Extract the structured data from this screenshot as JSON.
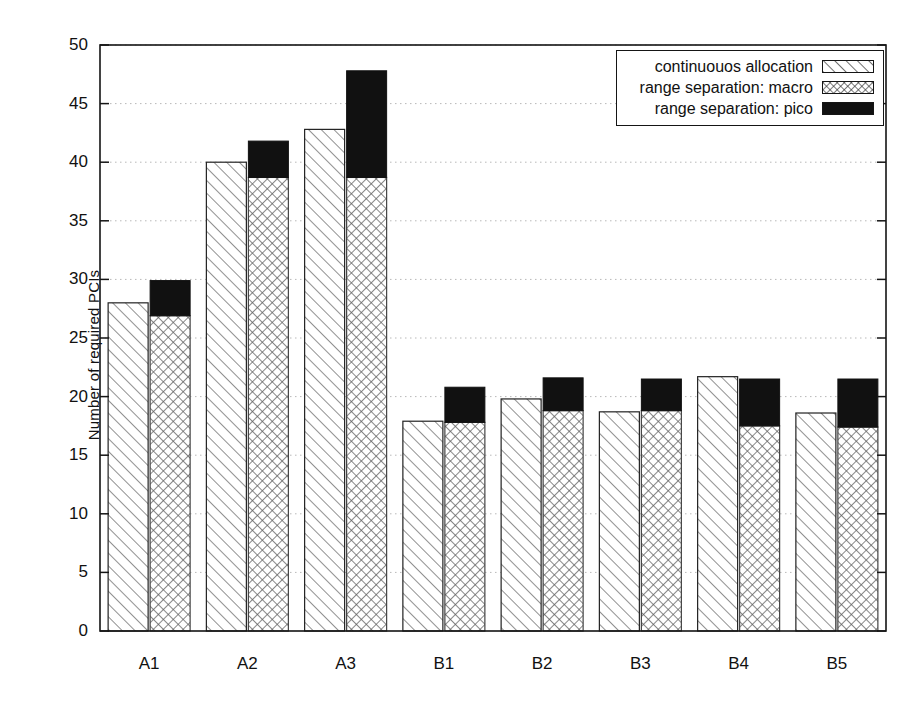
{
  "chart_data": {
    "type": "bar",
    "title": "",
    "subtitle": "",
    "xlabel": "",
    "ylabel": "Number of required PCIs",
    "categories": [
      "A1",
      "A2",
      "A3",
      "B1",
      "B2",
      "B3",
      "B4",
      "B5"
    ],
    "ylim": [
      0,
      50
    ],
    "yticks": [
      0,
      5,
      10,
      15,
      20,
      25,
      30,
      35,
      40,
      45,
      50
    ],
    "ytick_labels": [
      "0",
      "5",
      "10",
      "15",
      "20",
      "25",
      "30",
      "35",
      "40",
      "45",
      "50"
    ],
    "grid": true,
    "grid_style": "dotted-horizontal",
    "legend_position": "top-right",
    "stacked": "second bar is macro + pico stacked",
    "series": [
      {
        "name": "continuouos allocation",
        "pattern": "diagonal-hatch",
        "fill": "#ffffff",
        "line": "#222222",
        "values": [
          28.0,
          40.0,
          42.8,
          17.9,
          19.8,
          18.7,
          21.7,
          18.6
        ]
      },
      {
        "name": "range separation: macro",
        "pattern": "crosshatch",
        "fill": "#ffffff",
        "line": "#444444",
        "values": [
          26.9,
          38.7,
          38.7,
          17.8,
          18.8,
          18.8,
          17.5,
          17.4
        ]
      },
      {
        "name": "range separation: pico",
        "pattern": "solid",
        "fill": "#111111",
        "line": "#111111",
        "values": [
          3.0,
          3.1,
          9.1,
          3.0,
          2.8,
          2.7,
          4.0,
          4.1
        ],
        "stacked_tops": [
          29.9,
          41.8,
          47.8,
          20.8,
          21.6,
          21.5,
          21.5,
          21.5
        ]
      }
    ]
  },
  "legend": {
    "items": [
      {
        "label": "continuouos allocation",
        "swatch": "diagonal-hatch-swatch"
      },
      {
        "label": "range separation: macro",
        "swatch": "crosshatch-swatch"
      },
      {
        "label": "range separation: pico",
        "swatch": "solid-black-swatch"
      }
    ]
  },
  "colors": {
    "axis": "#151515",
    "grid": "#b8b8b8",
    "pico": "#111111",
    "background": "#ffffff"
  }
}
